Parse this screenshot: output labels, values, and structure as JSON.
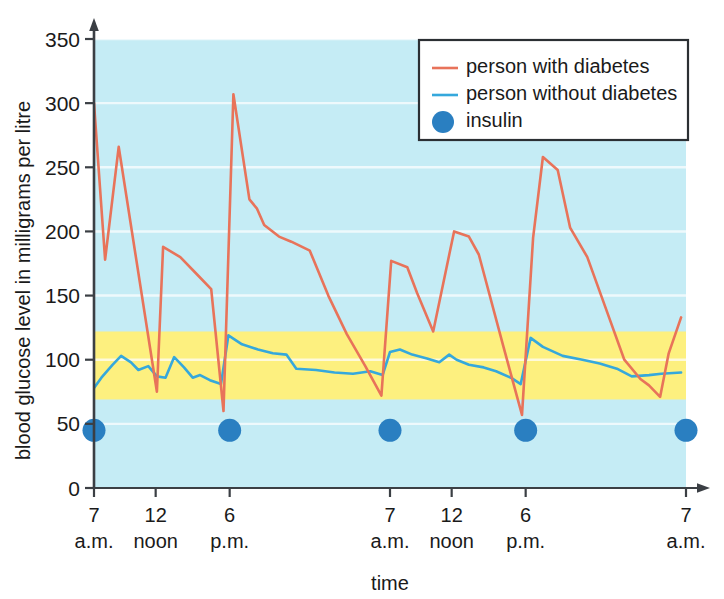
{
  "chart_data": {
    "type": "line",
    "title": "",
    "xlabel": "time",
    "ylabel": "blood glucose level in milligrams per litre",
    "ylim": [
      0,
      350
    ],
    "xlim": [
      0,
      48
    ],
    "grid": true,
    "y_ticks": [
      0,
      50,
      100,
      150,
      200,
      250,
      300,
      350
    ],
    "y_tick_labels": [
      "0",
      "50",
      "100",
      "150",
      "200",
      "250",
      "300",
      "350"
    ],
    "x_ticks": [
      0,
      5,
      11,
      24,
      29,
      35,
      48
    ],
    "x_tick_labels": [
      {
        "num": "7",
        "sub": "a.m."
      },
      {
        "num": "12",
        "sub": "noon"
      },
      {
        "num": "6",
        "sub": "p.m."
      },
      {
        "num": "7",
        "sub": "a.m."
      },
      {
        "num": "12",
        "sub": "noon"
      },
      {
        "num": "6",
        "sub": "p.m."
      },
      {
        "num": "7",
        "sub": "a.m."
      }
    ],
    "legend": {
      "position": "top-right",
      "entries": [
        {
          "label": "person with diabetes",
          "marker": "line",
          "color": "#e8735a"
        },
        {
          "label": "person without diabetes",
          "marker": "line",
          "color": "#35a8dc"
        },
        {
          "label": "insulin",
          "marker": "dot",
          "color": "#2a7fc1"
        }
      ]
    },
    "bands": [
      {
        "name": "normal-range-band",
        "from": 69,
        "to": 122,
        "color": "#fdf07f"
      },
      {
        "name": "plot-background",
        "from": 0,
        "to": 350,
        "color": "#c5ecf5"
      }
    ],
    "series": [
      {
        "name": "person with diabetes",
        "color": "#e8735a",
        "points": [
          [
            0,
            300
          ],
          [
            0.9,
            178
          ],
          [
            2.0,
            266
          ],
          [
            5.1,
            75
          ],
          [
            5.6,
            188
          ],
          [
            7.0,
            180
          ],
          [
            8.4,
            166
          ],
          [
            9.5,
            155
          ],
          [
            10.5,
            60
          ],
          [
            11.3,
            307
          ],
          [
            12.6,
            225
          ],
          [
            13.2,
            218
          ],
          [
            13.8,
            205
          ],
          [
            15.0,
            196
          ],
          [
            16.0,
            192
          ],
          [
            17.5,
            185
          ],
          [
            19.0,
            150
          ],
          [
            20.5,
            120
          ],
          [
            22.0,
            95
          ],
          [
            23.3,
            72
          ],
          [
            24.1,
            177
          ],
          [
            25.4,
            172
          ],
          [
            26.2,
            152
          ],
          [
            27.5,
            122
          ],
          [
            29.2,
            200
          ],
          [
            30.4,
            196
          ],
          [
            31.2,
            182
          ],
          [
            33.2,
            110
          ],
          [
            34.7,
            57
          ],
          [
            35.6,
            195
          ],
          [
            36.4,
            258
          ],
          [
            37.6,
            248
          ],
          [
            38.6,
            203
          ],
          [
            40.0,
            180
          ],
          [
            41.5,
            140
          ],
          [
            43.0,
            100
          ],
          [
            44.3,
            85
          ],
          [
            45.0,
            80
          ],
          [
            45.9,
            71
          ],
          [
            46.6,
            105
          ],
          [
            47.6,
            133
          ]
        ]
      },
      {
        "name": "person without diabetes",
        "color": "#35a8dc",
        "points": [
          [
            0,
            78
          ],
          [
            0.6,
            86
          ],
          [
            1.5,
            96
          ],
          [
            2.2,
            103
          ],
          [
            3.0,
            98
          ],
          [
            3.6,
            92
          ],
          [
            4.4,
            95
          ],
          [
            5.1,
            87
          ],
          [
            5.8,
            86
          ],
          [
            6.5,
            102
          ],
          [
            7.3,
            94
          ],
          [
            8.0,
            86
          ],
          [
            8.6,
            88
          ],
          [
            9.4,
            84
          ],
          [
            10.3,
            81
          ],
          [
            10.9,
            119
          ],
          [
            12.0,
            112
          ],
          [
            13.3,
            108
          ],
          [
            14.5,
            105
          ],
          [
            15.6,
            104
          ],
          [
            16.4,
            93
          ],
          [
            18.0,
            92
          ],
          [
            19.5,
            90
          ],
          [
            21.0,
            89
          ],
          [
            22.4,
            91
          ],
          [
            23.4,
            88
          ],
          [
            24.0,
            106
          ],
          [
            24.8,
            108
          ],
          [
            25.8,
            104
          ],
          [
            27.0,
            101
          ],
          [
            28.0,
            98
          ],
          [
            28.8,
            104
          ],
          [
            29.4,
            100
          ],
          [
            30.4,
            96
          ],
          [
            31.6,
            94
          ],
          [
            32.6,
            91
          ],
          [
            33.8,
            86
          ],
          [
            34.6,
            81
          ],
          [
            35.4,
            117
          ],
          [
            36.4,
            110
          ],
          [
            38.0,
            103
          ],
          [
            39.6,
            100
          ],
          [
            41.0,
            97
          ],
          [
            42.4,
            93
          ],
          [
            43.6,
            87
          ],
          [
            45.0,
            88
          ],
          [
            46.0,
            89
          ],
          [
            47.6,
            90
          ]
        ]
      }
    ],
    "insulin_doses": {
      "name": "insulin",
      "color": "#2a7fc1",
      "level": 45,
      "times": [
        0,
        11,
        24,
        35,
        48
      ]
    }
  }
}
